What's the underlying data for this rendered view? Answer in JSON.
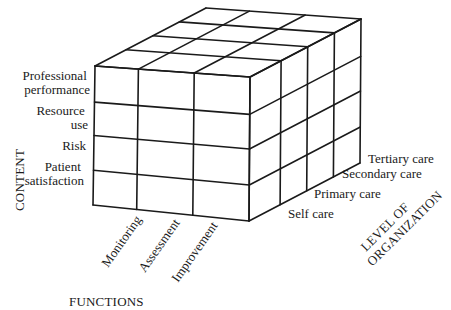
{
  "diagram": {
    "type": "3d-cube-matrix",
    "stroke_color": "#1a1a1a",
    "background": "#ffffff",
    "geometry": {
      "front_top_left": [
        95,
        66
      ],
      "front_top_right": [
        250,
        77
      ],
      "front_bottom_left": [
        93,
        205
      ],
      "front_bottom_right": [
        249,
        221
      ],
      "depth_vector": [
        111,
        -58
      ],
      "column_x_fractions": [
        0,
        0.28,
        0.64,
        1.0
      ],
      "row_y_fractions": [
        0,
        0.26,
        0.5,
        0.75,
        1.0
      ],
      "depth_fractions": [
        0,
        0.28,
        0.52,
        0.76,
        1.0
      ]
    },
    "content_axis": {
      "title": "CONTENT",
      "items": [
        {
          "lines": [
            "Professional",
            "performance"
          ]
        },
        {
          "lines": [
            "Resource",
            "use"
          ]
        },
        {
          "lines": [
            "Risk"
          ]
        },
        {
          "lines": [
            "Patient",
            "satisfaction"
          ]
        }
      ]
    },
    "functions_axis": {
      "title": "FUNCTIONS",
      "items": [
        "Monitoring",
        "Assessment",
        "Improvement"
      ]
    },
    "organization_axis": {
      "title_lines": [
        "LEVEL OF",
        "ORGANIZATION"
      ],
      "items": [
        "Self care",
        "Primary care",
        "Secondary care",
        "Tertiary care"
      ]
    }
  }
}
